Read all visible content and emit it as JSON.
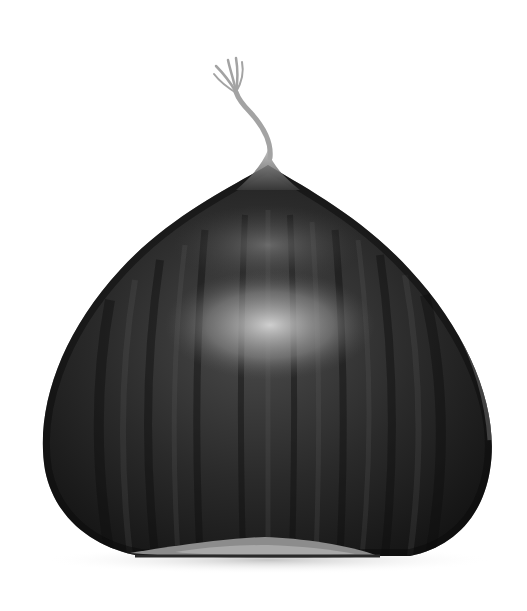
{
  "image": {
    "subject": "chestnut",
    "description": "A single dark grayscale chestnut with a twisted wispy tuft on top, on a white background",
    "background_color": "#ffffff",
    "colors": {
      "shell_dark": "#1c1c1c",
      "shell_mid": "#3a3a3a",
      "highlight": "#cfcfcf",
      "tuft": "#a8a8a8",
      "base_scar": "#8e8e8e",
      "shadow": "#d8d8d8"
    }
  }
}
